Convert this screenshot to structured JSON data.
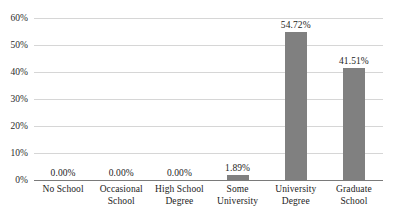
{
  "chart_data": {
    "type": "bar",
    "title": "",
    "subtitle": "",
    "xlabel": "",
    "ylabel": "",
    "categories": [
      "No School",
      "Occasional School",
      "High School Degree",
      "Some University",
      "University Degree",
      "Graduate School"
    ],
    "category_lines": [
      [
        "No School",
        ""
      ],
      [
        "Occasional",
        "School"
      ],
      [
        "High School",
        "Degree"
      ],
      [
        "Some",
        "University"
      ],
      [
        "University",
        "Degree"
      ],
      [
        "Graduate",
        "School"
      ]
    ],
    "values": [
      0.0,
      0.0,
      0.0,
      1.89,
      54.72,
      41.51
    ],
    "value_labels": [
      "0.00%",
      "0.00%",
      "0.00%",
      "1.89%",
      "54.72%",
      "41.51%"
    ],
    "ylim": [
      0,
      60
    ],
    "ytick_values": [
      0,
      10,
      20,
      30,
      40,
      50,
      60
    ],
    "ytick_labels": [
      "0%",
      "10%",
      "20%",
      "30%",
      "40%",
      "50%",
      "60%"
    ],
    "grid": true,
    "legend": "none",
    "bar_color": "#808080",
    "gridline_color": "#d6d6d6",
    "axis_color": "#7a7a7a",
    "background_color": "#ffffff",
    "text_color": "#1c1c1c"
  }
}
